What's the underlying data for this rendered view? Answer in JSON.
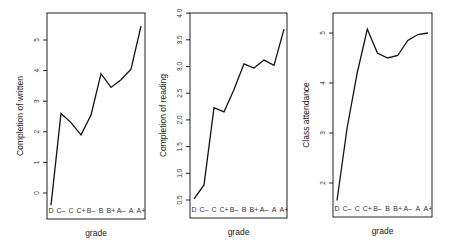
{
  "chart_data": [
    {
      "type": "line",
      "title": "",
      "xlabel": "grade",
      "ylabel": "Completion of written",
      "categories": [
        "D",
        "C–",
        "C",
        "C+",
        "B–",
        "B",
        "B+",
        "A–",
        "A",
        "A+"
      ],
      "values": [
        -0.4,
        2.6,
        2.3,
        1.9,
        2.55,
        3.9,
        3.45,
        3.7,
        4.05,
        5.45
      ],
      "yticks": [
        0,
        1,
        2,
        3,
        4,
        5
      ],
      "ylim": [
        -0.85,
        5.9
      ],
      "grid": false,
      "legend": null
    },
    {
      "type": "line",
      "title": "",
      "xlabel": "grade",
      "ylabel": "Completion of reading",
      "categories": [
        "D",
        "C–",
        "C",
        "C+",
        "B–",
        "B",
        "B+",
        "A–",
        "A",
        "A+"
      ],
      "values": [
        0.52,
        0.78,
        2.23,
        2.15,
        2.57,
        3.05,
        2.97,
        3.12,
        3.02,
        3.7
      ],
      "yticks": [
        "0.5",
        "1.0",
        "1.5",
        "2.0",
        "2.5",
        "3.0",
        "3.5",
        "4.0"
      ],
      "ylim": [
        0.16,
        4.0
      ],
      "grid": false,
      "legend": null
    },
    {
      "type": "line",
      "title": "",
      "xlabel": "grade",
      "ylabel": "Class attendance",
      "categories": [
        "D",
        "C–",
        "C",
        "C+",
        "B–",
        "B",
        "B+",
        "A–",
        "A",
        "A+"
      ],
      "values": [
        1.65,
        3.1,
        4.2,
        5.08,
        4.6,
        4.5,
        4.55,
        4.85,
        4.97,
        5.0
      ],
      "yticks": [
        2,
        3,
        4,
        5
      ],
      "ylim": [
        1.32,
        5.4
      ],
      "grid": false,
      "legend": null
    }
  ]
}
